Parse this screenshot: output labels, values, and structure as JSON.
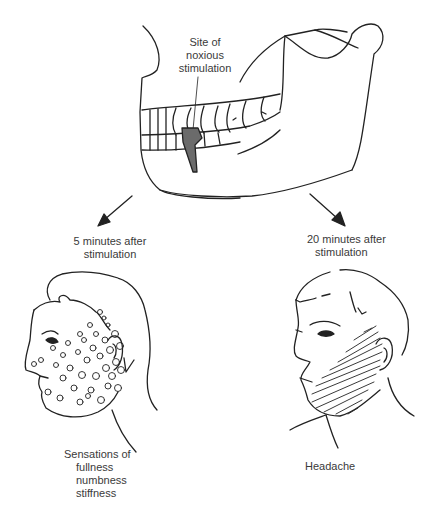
{
  "diagram": {
    "top": {
      "label_lines": [
        "Site of",
        "noxious",
        "stimulation"
      ],
      "highlight_color": "#6b6b6b"
    },
    "left": {
      "caption_lines": [
        "5 minutes after",
        "stimulation"
      ],
      "result_lines": [
        "Sensations of",
        "fullness",
        "numbness",
        "stiffness"
      ]
    },
    "right": {
      "caption_lines": [
        "20 minutes after",
        "stimulation"
      ],
      "result_lines": [
        "Headache"
      ]
    },
    "colors": {
      "line": "#222222",
      "text": "#3a3a3a"
    }
  }
}
